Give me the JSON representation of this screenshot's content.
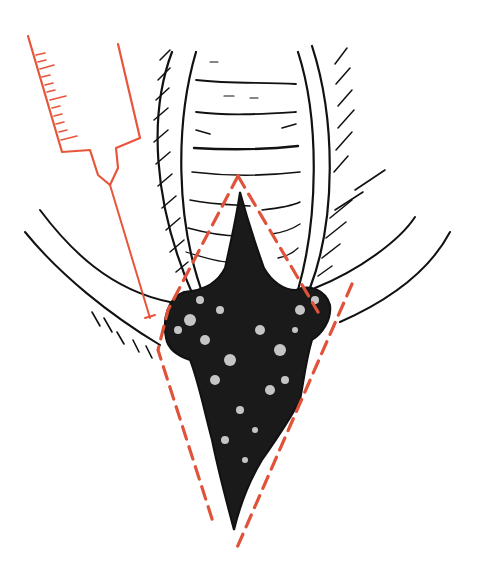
{
  "figure": {
    "type": "medical-illustration",
    "caption": "",
    "colors": {
      "ink": "#111111",
      "syringe": "#e8553a",
      "incision": "#e0533a",
      "background": "#ffffff"
    },
    "elements": [
      {
        "name": "syringe",
        "color": "#e8553a",
        "graduation_ticks": 12
      },
      {
        "name": "vaginal-canal-rugae",
        "color": "#111111"
      },
      {
        "name": "labia-folds",
        "color": "#111111"
      },
      {
        "name": "lesion-mass",
        "color": "#111111"
      },
      {
        "name": "dashed-excision-outline",
        "color": "#e0533a",
        "shape": "diamond"
      }
    ]
  }
}
